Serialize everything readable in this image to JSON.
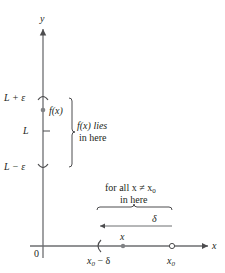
{
  "diagram": {
    "axes": {
      "x_label": "x",
      "y_label": "y",
      "origin_label": "0"
    },
    "y_marks": {
      "upper": "L + ε",
      "center": "L",
      "lower": "L − ε",
      "point_label": "f(x)"
    },
    "y_bracket_note": {
      "line1": "f(x) lies",
      "line2": "in here"
    },
    "x_bracket_note": {
      "line1": "for all x ≠ x",
      "line1_sub": "0",
      "line2": "in here"
    },
    "delta_label": "δ",
    "x_marks": {
      "left_label": "x",
      "left_label_sub": "0",
      "left_label_suffix": " − δ",
      "point_label": "x",
      "center_label": "x",
      "center_label_sub": "0"
    },
    "colors": {
      "axis": "#6d6e71",
      "text": "#231f20",
      "point": "#808285"
    }
  }
}
